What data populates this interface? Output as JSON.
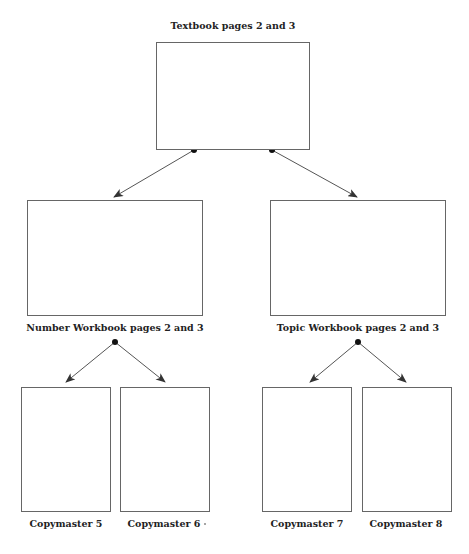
{
  "diagram": {
    "colors": {
      "line": "#555555",
      "dot": "#111111",
      "text": "#222222"
    },
    "nodes": [
      {
        "id": "textbook",
        "label": "Textbook pages 2 and 3",
        "box": [
          156,
          42,
          154,
          108
        ],
        "label_pos": [
          233,
          20
        ]
      },
      {
        "id": "number_workbook",
        "label": "Number Workbook pages 2 and 3",
        "box": [
          27,
          200,
          176,
          116
        ],
        "label_pos": [
          115,
          322
        ]
      },
      {
        "id": "topic_workbook",
        "label": "Topic Workbook pages 2 and 3",
        "box": [
          270,
          200,
          176,
          116
        ],
        "label_pos": [
          358,
          322
        ]
      },
      {
        "id": "copymaster_5",
        "label": "Copymaster 5",
        "box": [
          21,
          387,
          90,
          125
        ],
        "label_pos": [
          66,
          518
        ]
      },
      {
        "id": "copymaster_6",
        "label": "Copymaster 6",
        "box": [
          120,
          387,
          90,
          125
        ],
        "label_pos": [
          164,
          518
        ]
      },
      {
        "id": "copymaster_7",
        "label": "Copymaster 7",
        "box": [
          262,
          387,
          90,
          125
        ],
        "label_pos": [
          307,
          518
        ]
      },
      {
        "id": "copymaster_8",
        "label": "Copymaster 8",
        "box": [
          362,
          387,
          90,
          125
        ],
        "label_pos": [
          406,
          518
        ]
      }
    ],
    "edges": [
      {
        "from": [
          194,
          150
        ],
        "to": [
          114,
          197
        ],
        "target": "number_workbook"
      },
      {
        "from": [
          272,
          150
        ],
        "to": [
          357,
          197
        ],
        "target": "topic_workbook"
      },
      {
        "from": [
          115,
          342
        ],
        "to": [
          66,
          382
        ],
        "target": "copymaster_5"
      },
      {
        "from": [
          115,
          342
        ],
        "to": [
          165,
          382
        ],
        "target": "copymaster_6"
      },
      {
        "from": [
          358,
          342
        ],
        "to": [
          310,
          382
        ],
        "target": "copymaster_7"
      },
      {
        "from": [
          358,
          342
        ],
        "to": [
          406,
          382
        ],
        "target": "copymaster_8"
      }
    ],
    "dots": [
      [
        194,
        150
      ],
      [
        272,
        150
      ],
      [
        115,
        342
      ],
      [
        358,
        342
      ]
    ]
  }
}
